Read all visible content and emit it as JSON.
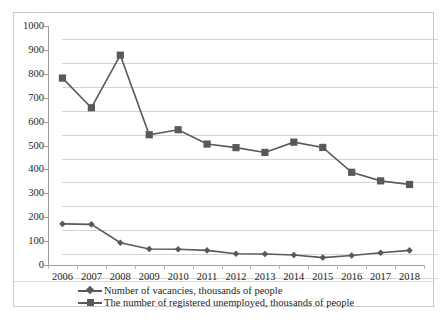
{
  "chart_data": {
    "type": "line",
    "title": "",
    "xlabel": "",
    "ylabel": "",
    "categories": [
      "2006",
      "2007",
      "2008",
      "2009",
      "2010",
      "2011",
      "2012",
      "2013",
      "2014",
      "2015",
      "2016",
      "2017",
      "2018"
    ],
    "ylim": [
      0,
      1000
    ],
    "ytick_labels": [
      "0",
      "100",
      "200",
      "300",
      "400",
      "500",
      "600",
      "700",
      "800",
      "900",
      "1000"
    ],
    "yticks": [
      0,
      100,
      200,
      300,
      400,
      500,
      600,
      700,
      800,
      900,
      1000
    ],
    "grid": true,
    "legend_position": "bottom",
    "series": [
      {
        "name": "Number of vacancies, thousands of people",
        "marker": "diamond",
        "color": "#595959",
        "values": [
          172,
          170,
          93,
          67,
          66,
          61,
          47,
          46,
          42,
          31,
          40,
          51,
          61
        ]
      },
      {
        "name": "The number of registered unemployed, thousands of people",
        "marker": "square",
        "color": "#595959",
        "values": [
          782,
          658,
          878,
          545,
          566,
          506,
          491,
          471,
          514,
          492,
          388,
          352,
          337
        ]
      }
    ]
  },
  "legend": {
    "items": [
      {
        "label": "Number of vacancies, thousands of people",
        "marker": "diamond-marker"
      },
      {
        "label": "The number of registered unemployed, thousands of people",
        "marker": "square-marker"
      }
    ]
  },
  "style": {
    "series_color": "#595959",
    "grid_color": "#d4d4d4",
    "axis_color": "#9e9e9e",
    "border_color": "#c9c9c9",
    "text_color": "#231f20"
  }
}
